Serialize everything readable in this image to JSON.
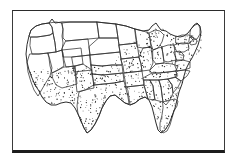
{
  "figure": {
    "kind": "thematic-map",
    "caption": "",
    "background_color": "#ffffff",
    "line_color": "#303030",
    "stipple_color": "#262626",
    "frame_color": "#2b2b2b",
    "frame": {
      "present": true,
      "x": 12,
      "y": 10,
      "width": 213,
      "height": 143,
      "bottom_edge_thicker": true
    }
  },
  "legend": {
    "present": false,
    "entries": [
      {
        "label": "Stippled (shaded) range",
        "pattern": "dots"
      },
      {
        "label": "Unshaded (outside range)",
        "pattern": "blank"
      }
    ]
  },
  "chart_data": {
    "type": "map",
    "xlabel": "",
    "ylabel": "",
    "projection": "unspecified outline of contiguous USA",
    "shading_scheme": "binary: stippled vs blank",
    "stippled_regions": [
      "California",
      "Nevada",
      "Utah",
      "Arizona",
      "New Mexico",
      "Colorado",
      "Kansas",
      "Oklahoma",
      "Texas",
      "Missouri",
      "Arkansas",
      "Louisiana",
      "Iowa",
      "Illinois",
      "Indiana",
      "Ohio",
      "Kentucky",
      "Tennessee",
      "Mississippi",
      "Alabama",
      "Georgia",
      "Florida",
      "South Carolina",
      "North Carolina",
      "Virginia",
      "West Virginia",
      "Maryland",
      "Delaware",
      "New Jersey",
      "Pennsylvania",
      "New York",
      "Connecticut",
      "Rhode Island",
      "Massachusetts",
      "Michigan",
      "Wisconsin",
      "Minnesota"
    ],
    "blank_regions": [
      "Washington",
      "Oregon",
      "Idaho",
      "Montana",
      "Wyoming",
      "North Dakota",
      "South Dakota",
      "Nebraska",
      "Maine",
      "New Hampshire",
      "Vermont"
    ],
    "stipple_density_per_sq_unit": "high, uniform random",
    "estimated_dot_count": 1450
  },
  "map": {
    "outline_name": "contiguous-united-states",
    "state_borders_visible": true,
    "labels_visible": false,
    "graticule_visible": false
  }
}
